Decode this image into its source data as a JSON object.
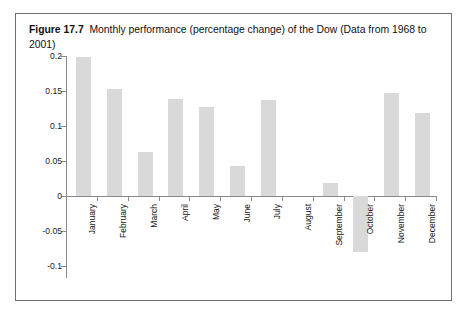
{
  "caption": {
    "figure_label": "Figure 17.7",
    "text": "Monthly performance (percentage change) of the Dow (Data from 1968 to 2001)"
  },
  "colors": {
    "bar_fill": "#d9d9d9",
    "axis": "#8a8a8a",
    "frame_border": "#6f6f6f",
    "text": "#111111",
    "background": "#ffffff"
  },
  "chart_data": {
    "type": "bar",
    "title": "Monthly performance (percentage change) of the Dow (Data from 1968 to 2001)",
    "xlabel": "",
    "ylabel": "",
    "categories": [
      "January",
      "February",
      "March",
      "April",
      "May",
      "June",
      "July",
      "August",
      "September",
      "October",
      "November",
      "December"
    ],
    "values": [
      0.198,
      0.153,
      0.063,
      0.138,
      0.127,
      0.043,
      0.137,
      0.0,
      0.018,
      -0.08,
      0.147,
      0.119
    ],
    "ylim": [
      -0.1,
      0.2
    ],
    "yticks": [
      0.2,
      0.15,
      0.1,
      0.05,
      0,
      -0.05,
      -0.1
    ],
    "ytick_labels": [
      "0.2",
      "0.15",
      "0.1",
      "0.05",
      "0",
      "-0.05",
      "-0.1"
    ],
    "grid": false,
    "legend": false,
    "x_label_rotation": -90
  }
}
